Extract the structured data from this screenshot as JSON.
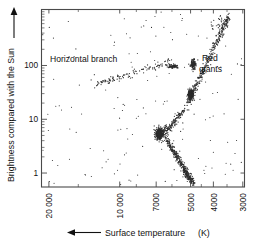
{
  "figure": {
    "type": "scatter"
  },
  "chart_data": {
    "type": "scatter",
    "title": "",
    "subtitle": "",
    "xlabel": "Surface temperature",
    "xlabel_unit": "(K)",
    "xlabel_arrow": "left",
    "ylabel": "Brightness compared with the Sun",
    "ylabel_arrow": "up",
    "x_scale": "log-reversed",
    "y_scale": "log",
    "xlim": [
      21500,
      2950
    ],
    "ylim": [
      0.55,
      1100
    ],
    "grid": false,
    "legend": null,
    "x_ticks": [
      {
        "value": 20000,
        "label": "20 000"
      },
      {
        "value": 10000,
        "label": "10 000"
      },
      {
        "value": 7000,
        "label": "7000"
      },
      {
        "value": 5000,
        "label": "5000"
      },
      {
        "value": 4000,
        "label": "4000"
      },
      {
        "value": 3000,
        "label": "3000"
      }
    ],
    "x_minor_ticks": [
      15000,
      8500,
      6000,
      4500,
      3500
    ],
    "y_ticks": [
      {
        "value": 1,
        "label": "1"
      },
      {
        "value": 10,
        "label": "10"
      },
      {
        "value": 100,
        "label": "100"
      }
    ],
    "y_minor_ticks": [
      2,
      3,
      4,
      5,
      6,
      7,
      8,
      9,
      20,
      30,
      40,
      50,
      60,
      70,
      80,
      90,
      200,
      300,
      400,
      500,
      600,
      700,
      800,
      900,
      1000
    ],
    "annotations": [
      {
        "name": "horizontal-branch",
        "text": "Horizontal branch",
        "x": 12500,
        "y": 230,
        "lines": [
          "Horizontal branch"
        ]
      },
      {
        "name": "red-giants",
        "text": "Red giants",
        "x": 3850,
        "y": 230,
        "lines": [
          "Red",
          "giants"
        ]
      }
    ],
    "series": [
      {
        "name": "cluster stars",
        "marker": "dot",
        "color": "#2b2b2b",
        "components": [
          {
            "component": "red-giant-branch",
            "note": "rises from main-sequence turnoff to upper right, cool and luminous",
            "points_approx": 330,
            "temp_range": [
              5600,
              3400
            ],
            "brightness_range": [
              8,
              900
            ]
          },
          {
            "component": "red-giant-clump",
            "note": "dense concentration on the giant branch near 30 solar luminosities",
            "points_approx": 180,
            "temp_range": [
              5200,
              4750
            ],
            "brightness_range": [
              18,
              45
            ]
          },
          {
            "component": "horizontal-branch",
            "note": "sloping band of hot evolved stars near 100 solar luminosities",
            "points_approx": 120,
            "temp_range": [
              12500,
              5700
            ],
            "brightness_range": [
              45,
              130
            ]
          },
          {
            "component": "main-sequence-turnoff",
            "note": "dense knot where stars leave the main sequence",
            "points_approx": 260,
            "temp_range": [
              7200,
              6300
            ],
            "brightness_range": [
              3.5,
              8
            ]
          },
          {
            "component": "main-sequence",
            "note": "descending band of faint cool dwarfs below the turnoff",
            "points_approx": 420,
            "temp_range": [
              6400,
              4900
            ],
            "brightness_range": [
              0.6,
              4
            ]
          },
          {
            "component": "subgiant-branch",
            "note": "bridge between turnoff and giant branch",
            "points_approx": 150,
            "temp_range": [
              6300,
              5300
            ],
            "brightness_range": [
              5,
              14
            ]
          },
          {
            "component": "field-scatter",
            "note": "sparse scattered field stars across the diagram",
            "points_approx": 150,
            "temp_range": [
              20000,
              3200
            ],
            "brightness_range": [
              0.7,
              600
            ]
          }
        ]
      }
    ]
  }
}
